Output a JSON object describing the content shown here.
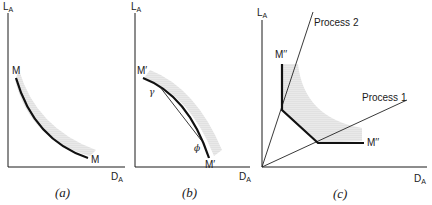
{
  "figure": {
    "panels": [
      {
        "id": "a",
        "caption": "(a)",
        "y_axis_label": "L",
        "y_axis_sub": "A",
        "x_axis_label": "D",
        "x_axis_sub": "A",
        "curve_label_start": "M",
        "curve_label_end": "M"
      },
      {
        "id": "b",
        "caption": "(b)",
        "y_axis_label": "L",
        "y_axis_sub": "A",
        "x_axis_label": "D",
        "x_axis_sub": "A",
        "curve_label_start": "M′",
        "curve_label_end": "M′",
        "chord_start_label": "γ",
        "chord_end_label": "ϕ"
      },
      {
        "id": "c",
        "caption": "(c)",
        "y_axis_label": "L",
        "y_axis_sub": "A",
        "x_axis_label": "D",
        "x_axis_sub": "A",
        "curve_label_start": "M′′",
        "curve_label_end": "M′′",
        "ray_1_label": "Process 1",
        "ray_2_label": "Process 2"
      }
    ],
    "colors": {
      "ink": "#111111",
      "shading": "#bdbdbd"
    }
  }
}
